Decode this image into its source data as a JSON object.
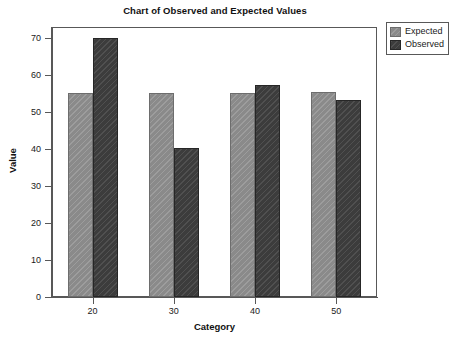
{
  "chart_data": {
    "type": "bar",
    "title": "Chart of Observed and Expected Values",
    "xlabel": "Category",
    "ylabel": "Value",
    "categories": [
      "20",
      "30",
      "40",
      "50"
    ],
    "series": [
      {
        "name": "Expected",
        "color": "#8a8a8a",
        "values": [
          55.2,
          55.2,
          55.2,
          55.4
        ]
      },
      {
        "name": "Observed",
        "color": "#3c3c3c",
        "values": [
          70.0,
          40.2,
          57.4,
          53.4
        ]
      }
    ],
    "ylim": [
      0,
      73
    ],
    "yticks": [
      0,
      10,
      20,
      30,
      40,
      50,
      60,
      70
    ],
    "ytick_labels": [
      "0",
      "10",
      "20",
      "30",
      "40",
      "50",
      "60",
      "70"
    ],
    "grid": false,
    "legend_position": "right-top",
    "legend_entries": [
      "Expected",
      "Observed"
    ]
  }
}
